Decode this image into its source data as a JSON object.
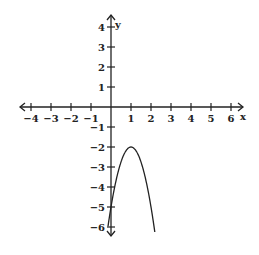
{
  "chart_data": {
    "type": "line",
    "title": "",
    "xlabel": "x",
    "ylabel": "y",
    "xlim": [
      -4,
      6
    ],
    "ylim": [
      -6,
      4
    ],
    "x_ticks": [
      "-4",
      "-3",
      "-2",
      "-1",
      "1",
      "2",
      "3",
      "4",
      "5",
      "6"
    ],
    "y_ticks": [
      "4",
      "3",
      "2",
      "1",
      "-1",
      "-2",
      "-3",
      "-4",
      "-5",
      "-6"
    ],
    "grid": false,
    "series": [
      {
        "name": "parabola",
        "equation": "y = -3(x-1)^2 - 2",
        "vertex": [
          1,
          -2
        ],
        "x": [
          -0.15,
          0,
          0.5,
          1,
          1.5,
          2,
          2.2
        ],
        "values": [
          -6,
          -5,
          -2.75,
          -2,
          -2.75,
          -5,
          -6
        ]
      }
    ]
  }
}
